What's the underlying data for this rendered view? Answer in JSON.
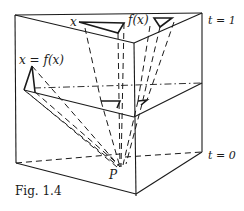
{
  "figure": {
    "caption": "Fig. 1.4",
    "labels": {
      "x": "x",
      "fx": "f(x)",
      "fixed_point": "x = f(x)",
      "t1": "t = 1",
      "t0": "t = 0",
      "P": "P"
    },
    "colors": {
      "ink": "#1a1a1a",
      "background": "#ffffff"
    }
  }
}
